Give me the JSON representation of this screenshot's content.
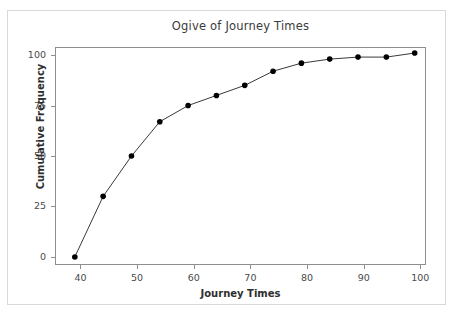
{
  "chart_data": {
    "type": "line",
    "title": "Ogive of Journey Times",
    "xlabel": "Journey Times",
    "ylabel": "Cumulative Frequency",
    "x": [
      39,
      44,
      49,
      54,
      59,
      64,
      69,
      74,
      79,
      84,
      89,
      94,
      99
    ],
    "values": [
      0,
      30,
      50,
      67,
      75,
      80,
      85,
      92,
      96,
      98,
      99,
      99,
      101
    ],
    "series": [
      {
        "name": "Cumulative Frequency",
        "values": [
          0,
          30,
          50,
          67,
          75,
          80,
          85,
          92,
          96,
          98,
          99,
          99,
          101
        ]
      }
    ],
    "xlim": [
      35.5,
      101
    ],
    "ylim": [
      -4,
      104
    ],
    "xticks": [
      40,
      50,
      60,
      70,
      80,
      90,
      100
    ],
    "xtick_labels": [
      "40",
      "50",
      "60",
      "70",
      "80",
      "90",
      "100"
    ],
    "yticks": [
      0,
      25,
      50,
      75,
      100
    ],
    "ytick_labels": [
      "0",
      "25",
      "50",
      "75",
      "100"
    ],
    "grid": false,
    "legend": false,
    "marker": "filled-circle",
    "marker_color": "#000000",
    "line_color": "#3a3a3a",
    "plot_background": "#ffffff",
    "frame_color": "#8e8e8e"
  }
}
